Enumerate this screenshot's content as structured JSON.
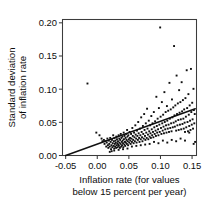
{
  "chart_data": {
    "type": "scatter",
    "title": "",
    "xlabel": "Inflation rate (for values below 15 percent per year)",
    "xlabel_line1": "Inflation rate (for values",
    "xlabel_line2": "below 15 percent per year)",
    "ylabel": "Standard deviation of inflation rate",
    "ylabel_line1": "Standard deviation",
    "ylabel_line2": "of inflation rate",
    "xlim": [
      -0.055,
      0.157
    ],
    "ylim": [
      0.0,
      0.205
    ],
    "xticks": [
      -0.05,
      0.0,
      0.05,
      0.1,
      0.15
    ],
    "yticks": [
      0.0,
      0.05,
      0.1,
      0.15,
      0.2
    ],
    "xtick_labels": [
      "-0.05",
      "0.00",
      "0.05",
      "0.10",
      "0.15"
    ],
    "ytick_labels": [
      "0.00",
      "0.05",
      "0.10",
      "0.15",
      "0.20"
    ],
    "grid": false,
    "legend": "none",
    "marker_color": "#101010",
    "line_color": "#111111",
    "frame_color": "#3c3c3c",
    "fit_line": {
      "label": "regression line",
      "x": [
        -0.05,
        0.155
      ],
      "y": [
        0.0,
        0.0705
      ],
      "slope": 0.344,
      "intercept": 0.0172
    },
    "points": [
      [
        -0.0155,
        0.1085
      ],
      [
        -0.0015,
        0.0345
      ],
      [
        0.0035,
        0.0305
      ],
      [
        0.0068,
        0.0255
      ],
      [
        0.0082,
        0.0215
      ],
      [
        0.0105,
        0.0235
      ],
      [
        0.0115,
        0.0175
      ],
      [
        0.0128,
        0.0215
      ],
      [
        0.0142,
        0.0135
      ],
      [
        0.015,
        0.0195
      ],
      [
        0.016,
        0.0255
      ],
      [
        0.0168,
        0.0155
      ],
      [
        0.0175,
        0.0115
      ],
      [
        0.0182,
        0.0225
      ],
      [
        0.019,
        0.0175
      ],
      [
        0.0198,
        0.0135
      ],
      [
        0.0205,
        0.0265
      ],
      [
        0.0212,
        0.0205
      ],
      [
        0.0218,
        0.0095
      ],
      [
        0.0225,
        0.0155
      ],
      [
        0.0232,
        0.0235
      ],
      [
        0.0238,
        0.0125
      ],
      [
        0.0245,
        0.0185
      ],
      [
        0.0252,
        0.0305
      ],
      [
        0.0258,
        0.0145
      ],
      [
        0.0262,
        0.0215
      ],
      [
        0.0268,
        0.0105
      ],
      [
        0.0272,
        0.0265
      ],
      [
        0.0278,
        0.0175
      ],
      [
        0.0282,
        0.0135
      ],
      [
        0.0288,
        0.0225
      ],
      [
        0.0292,
        0.0195
      ],
      [
        0.0298,
        0.0115
      ],
      [
        0.0302,
        0.0285
      ],
      [
        0.0308,
        0.0155
      ],
      [
        0.0312,
        0.0245
      ],
      [
        0.0318,
        0.0185
      ],
      [
        0.0322,
        0.0125
      ],
      [
        0.0328,
        0.0215
      ],
      [
        0.0332,
        0.0165
      ],
      [
        0.0338,
        0.0305
      ],
      [
        0.0342,
        0.0145
      ],
      [
        0.0348,
        0.0255
      ],
      [
        0.0352,
        0.0195
      ],
      [
        0.0358,
        0.0115
      ],
      [
        0.0362,
        0.0235
      ],
      [
        0.0368,
        0.0175
      ],
      [
        0.0372,
        0.0325
      ],
      [
        0.0378,
        0.0135
      ],
      [
        0.0382,
        0.0265
      ],
      [
        0.0388,
        0.0205
      ],
      [
        0.0392,
        0.0155
      ],
      [
        0.0398,
        0.0285
      ],
      [
        0.0402,
        0.0225
      ],
      [
        0.0408,
        0.0185
      ],
      [
        0.0412,
        0.0125
      ],
      [
        0.0418,
        0.0345
      ],
      [
        0.0422,
        0.0245
      ],
      [
        0.0428,
        0.0165
      ],
      [
        0.0432,
        0.0295
      ],
      [
        0.0438,
        0.0205
      ],
      [
        0.0442,
        0.0145
      ],
      [
        0.0448,
        0.0265
      ],
      [
        0.0452,
        0.0195
      ],
      [
        0.0458,
        0.0325
      ],
      [
        0.0462,
        0.0235
      ],
      [
        0.0468,
        0.0175
      ],
      [
        0.0472,
        0.0385
      ],
      [
        0.0478,
        0.0285
      ],
      [
        0.0482,
        0.0215
      ],
      [
        0.0488,
        0.0155
      ],
      [
        0.0492,
        0.0305
      ],
      [
        0.0498,
        0.0245
      ],
      [
        0.0505,
        0.0195
      ],
      [
        0.0512,
        0.0355
      ],
      [
        0.0518,
        0.0265
      ],
      [
        0.0522,
        0.0225
      ],
      [
        0.0528,
        0.0175
      ],
      [
        0.0535,
        0.0325
      ],
      [
        0.0542,
        0.0255
      ],
      [
        0.0548,
        0.0205
      ],
      [
        0.0555,
        0.0415
      ],
      [
        0.0562,
        0.0295
      ],
      [
        0.0568,
        0.0235
      ],
      [
        0.0575,
        0.0185
      ],
      [
        0.0582,
        0.0345
      ],
      [
        0.0588,
        0.0275
      ],
      [
        0.0595,
        0.0215
      ],
      [
        0.0602,
        0.0455
      ],
      [
        0.0608,
        0.0315
      ],
      [
        0.0615,
        0.0255
      ],
      [
        0.0622,
        0.0195
      ],
      [
        0.0628,
        0.0375
      ],
      [
        0.0635,
        0.0295
      ],
      [
        0.0642,
        0.0235
      ],
      [
        0.0648,
        0.0505
      ],
      [
        0.0655,
        0.0335
      ],
      [
        0.0662,
        0.0265
      ],
      [
        0.0668,
        0.0205
      ],
      [
        0.0675,
        0.0405
      ],
      [
        0.0682,
        0.0305
      ],
      [
        0.0688,
        0.0245
      ],
      [
        0.0695,
        0.0575
      ],
      [
        0.0702,
        0.0355
      ],
      [
        0.0708,
        0.0275
      ],
      [
        0.0715,
        0.0215
      ],
      [
        0.0722,
        0.0445
      ],
      [
        0.0728,
        0.0325
      ],
      [
        0.0735,
        0.0255
      ],
      [
        0.0742,
        0.0625
      ],
      [
        0.0748,
        0.0385
      ],
      [
        0.0755,
        0.0295
      ],
      [
        0.0762,
        0.0235
      ],
      [
        0.0768,
        0.0485
      ],
      [
        0.0775,
        0.0345
      ],
      [
        0.0782,
        0.0265
      ],
      [
        0.0788,
        0.0705
      ],
      [
        0.0795,
        0.0405
      ],
      [
        0.0802,
        0.0315
      ],
      [
        0.0808,
        0.0245
      ],
      [
        0.0815,
        0.0525
      ],
      [
        0.0822,
        0.0365
      ],
      [
        0.0828,
        0.0285
      ],
      [
        0.0835,
        0.0455
      ],
      [
        0.0842,
        0.0335
      ],
      [
        0.0848,
        0.0265
      ],
      [
        0.0855,
        0.0595
      ],
      [
        0.0862,
        0.0395
      ],
      [
        0.0868,
        0.0305
      ],
      [
        0.0875,
        0.0485
      ],
      [
        0.0882,
        0.0355
      ],
      [
        0.0888,
        0.0275
      ],
      [
        0.0895,
        0.0655
      ],
      [
        0.0902,
        0.0425
      ],
      [
        0.0908,
        0.0325
      ],
      [
        0.0915,
        0.0515
      ],
      [
        0.0922,
        0.0375
      ],
      [
        0.0928,
        0.0295
      ],
      [
        0.0935,
        0.0885
      ],
      [
        0.0942,
        0.0445
      ],
      [
        0.0948,
        0.0345
      ],
      [
        0.0955,
        0.0555
      ],
      [
        0.0962,
        0.0395
      ],
      [
        0.0968,
        0.0305
      ],
      [
        0.0975,
        0.0715
      ],
      [
        0.0982,
        0.0465
      ],
      [
        0.0988,
        0.0355
      ],
      [
        0.0995,
        0.193
      ],
      [
        0.1002,
        0.0585
      ],
      [
        0.1008,
        0.0415
      ],
      [
        0.1015,
        0.0325
      ],
      [
        0.1022,
        0.0805
      ],
      [
        0.1028,
        0.0485
      ],
      [
        0.1035,
        0.0375
      ],
      [
        0.1042,
        0.0615
      ],
      [
        0.1048,
        0.0435
      ],
      [
        0.1055,
        0.0335
      ],
      [
        0.1062,
        0.0955
      ],
      [
        0.1068,
        0.0505
      ],
      [
        0.1075,
        0.0395
      ],
      [
        0.1082,
        0.0655
      ],
      [
        0.1088,
        0.0455
      ],
      [
        0.1095,
        0.0345
      ],
      [
        0.1102,
        0.0745
      ],
      [
        0.1108,
        0.0525
      ],
      [
        0.1115,
        0.0405
      ],
      [
        0.1122,
        0.0675
      ],
      [
        0.1128,
        0.0465
      ],
      [
        0.1135,
        0.0355
      ],
      [
        0.1142,
        0.1095
      ],
      [
        0.1148,
        0.0555
      ],
      [
        0.1155,
        0.0415
      ],
      [
        0.1162,
        0.0695
      ],
      [
        0.1168,
        0.0485
      ],
      [
        0.1175,
        0.0365
      ],
      [
        0.1182,
        0.0845
      ],
      [
        0.1188,
        0.0575
      ],
      [
        0.1195,
        0.0425
      ],
      [
        0.1202,
        0.0725
      ],
      [
        0.1208,
        0.0495
      ],
      [
        0.1215,
        0.165
      ],
      [
        0.1222,
        0.0605
      ],
      [
        0.1228,
        0.0435
      ],
      [
        0.1235,
        0.0755
      ],
      [
        0.1242,
        0.0515
      ],
      [
        0.1248,
        0.0375
      ],
      [
        0.1255,
        0.1205
      ],
      [
        0.1262,
        0.0625
      ],
      [
        0.1268,
        0.0455
      ],
      [
        0.1275,
        0.0785
      ],
      [
        0.1282,
        0.0535
      ],
      [
        0.1288,
        0.0385
      ],
      [
        0.1295,
        0.0985
      ],
      [
        0.1302,
        0.0645
      ],
      [
        0.1308,
        0.0465
      ],
      [
        0.1315,
        0.0805
      ],
      [
        0.1322,
        0.0545
      ],
      [
        0.1328,
        0.0395
      ],
      [
        0.1335,
        0.1105
      ],
      [
        0.1342,
        0.0665
      ],
      [
        0.1348,
        0.0475
      ],
      [
        0.1355,
        0.0835
      ],
      [
        0.1362,
        0.0555
      ],
      [
        0.1368,
        0.0405
      ],
      [
        0.1375,
        0.0695
      ],
      [
        0.1382,
        0.0495
      ],
      [
        0.1388,
        0.0355
      ],
      [
        0.1395,
        0.0865
      ],
      [
        0.1402,
        0.0585
      ],
      [
        0.1408,
        0.0425
      ],
      [
        0.1415,
        0.1285
      ],
      [
        0.1422,
        0.0715
      ],
      [
        0.1428,
        0.0505
      ],
      [
        0.1435,
        0.0365
      ],
      [
        0.1442,
        0.0925
      ],
      [
        0.1448,
        0.0615
      ],
      [
        0.1455,
        0.0445
      ],
      [
        0.1462,
        0.0755
      ],
      [
        0.1468,
        0.0525
      ],
      [
        0.1475,
        0.0385
      ],
      [
        0.1482,
        0.1305
      ],
      [
        0.1488,
        0.0655
      ],
      [
        0.1495,
        0.0465
      ],
      [
        0.1502,
        0.0795
      ],
      [
        0.1508,
        0.0545
      ],
      [
        0.1515,
        0.0405
      ],
      [
        0.1522,
        0.1005
      ],
      [
        0.1528,
        0.0685
      ],
      [
        0.1535,
        0.0485
      ],
      [
        0.1542,
        0.0625
      ],
      [
        0.1548,
        0.0205
      ],
      [
        0.1525,
        0.0175
      ],
      [
        0.1455,
        0.0345
      ],
      [
        0.1388,
        0.0225
      ],
      [
        0.1318,
        0.0255
      ],
      [
        0.1248,
        0.0215
      ],
      [
        0.1178,
        0.0235
      ],
      [
        0.1108,
        0.0195
      ],
      [
        0.1038,
        0.0225
      ],
      [
        0.0968,
        0.0185
      ],
      [
        0.0898,
        0.0205
      ],
      [
        0.0828,
        0.0175
      ],
      [
        0.0758,
        0.0165
      ],
      [
        0.0688,
        0.0155
      ],
      [
        0.0618,
        0.0145
      ],
      [
        0.0548,
        0.0135
      ],
      [
        0.0478,
        0.0105
      ],
      [
        0.0408,
        0.0095
      ],
      [
        0.0338,
        0.0085
      ],
      [
        0.0268,
        0.0075
      ],
      [
        0.0228,
        0.0065
      ],
      [
        0.0198,
        0.0055
      ]
    ]
  }
}
